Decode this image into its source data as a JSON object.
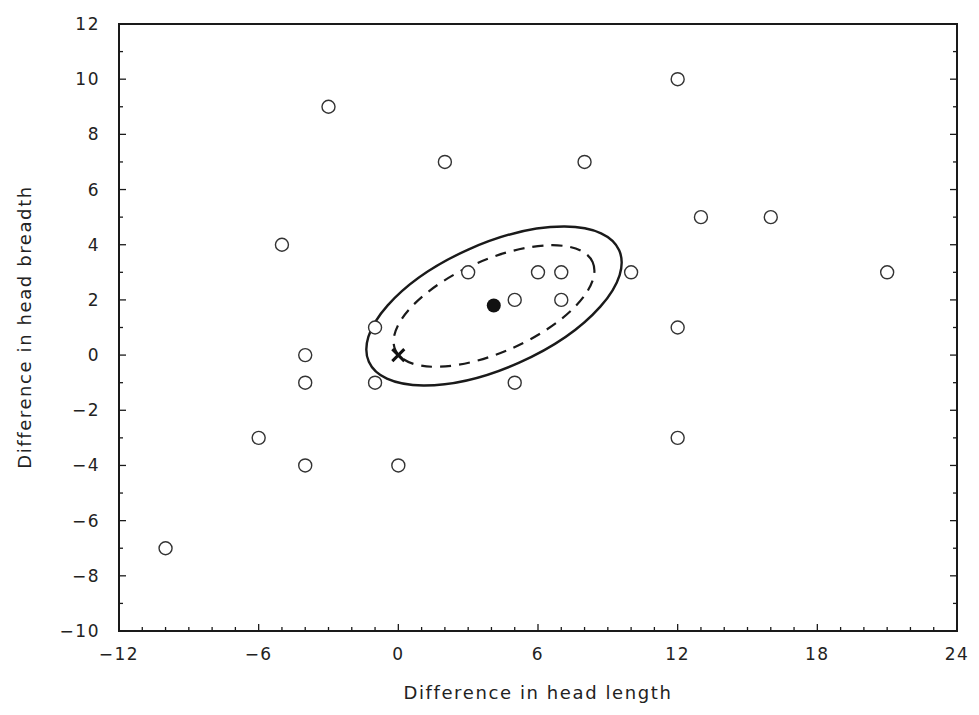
{
  "chart_data": {
    "type": "scatter",
    "title": "",
    "xlabel": "Difference in head length",
    "ylabel": "Difference in head breadth",
    "xlim": [
      -12,
      24
    ],
    "ylim": [
      -10,
      12
    ],
    "xticks": [
      -12,
      -6,
      0,
      6,
      12,
      18,
      24
    ],
    "xtick_labels": [
      "−12",
      "−6",
      "0",
      "6",
      "12",
      "18",
      "24"
    ],
    "yticks": [
      12,
      10,
      8,
      6,
      4,
      2,
      0,
      -2,
      -4,
      -6,
      -8,
      -10
    ],
    "ytick_labels": [
      "12",
      "10",
      "8",
      "6",
      "4",
      "2",
      "0",
      "−2",
      "−4",
      "−6",
      "−8",
      "−10"
    ],
    "grid": false,
    "legend": null,
    "series": [
      {
        "name": "observations",
        "marker": "open-circle",
        "points": [
          [
            -3,
            9
          ],
          [
            12,
            10
          ],
          [
            2,
            7
          ],
          [
            8,
            7
          ],
          [
            13,
            5
          ],
          [
            16,
            5
          ],
          [
            -5,
            4
          ],
          [
            3,
            3
          ],
          [
            6,
            3
          ],
          [
            7,
            3
          ],
          [
            10,
            3
          ],
          [
            21,
            3
          ],
          [
            5,
            2
          ],
          [
            7,
            2
          ],
          [
            -1,
            1
          ],
          [
            12,
            1
          ],
          [
            -4,
            0
          ],
          [
            -4,
            -1
          ],
          [
            -1,
            -1
          ],
          [
            5,
            -1
          ],
          [
            -6,
            -3
          ],
          [
            12,
            -3
          ],
          [
            -4,
            -4
          ],
          [
            0,
            -4
          ],
          [
            -10,
            -7
          ]
        ]
      },
      {
        "name": "sample mean",
        "marker": "filled-circle",
        "points": [
          [
            4.1,
            1.8
          ]
        ]
      },
      {
        "name": "null hypothesis origin",
        "marker": "cross",
        "points": [
          [
            0,
            0
          ]
        ]
      }
    ],
    "annotations": [
      {
        "type": "ellipse",
        "style": "solid",
        "center": [
          4.1,
          1.8
        ],
        "description": "outer confidence region"
      },
      {
        "type": "ellipse",
        "style": "dashed",
        "center": [
          4.1,
          1.8
        ],
        "description": "inner confidence region"
      }
    ]
  }
}
